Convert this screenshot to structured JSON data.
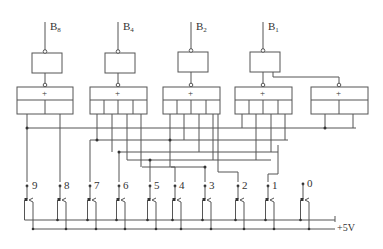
{
  "outputs": [
    {
      "name": "B",
      "sub": "8",
      "x": 45
    },
    {
      "name": "B",
      "sub": "4",
      "x": 118
    },
    {
      "name": "B",
      "sub": "2",
      "x": 191
    },
    {
      "name": "B",
      "sub": "1",
      "x": 263
    }
  ],
  "gates": {
    "or_symbol": "+"
  },
  "switches": [
    {
      "label": "9",
      "x": 27
    },
    {
      "label": "8",
      "x": 60
    },
    {
      "label": "7",
      "x": 90
    },
    {
      "label": "6",
      "x": 119
    },
    {
      "label": "5",
      "x": 150
    },
    {
      "label": "4",
      "x": 175
    },
    {
      "label": "3",
      "x": 205
    },
    {
      "label": "2",
      "x": 238
    },
    {
      "label": "1",
      "x": 268
    },
    {
      "label": "0",
      "x": 303
    }
  ],
  "supply": {
    "label": "+5V"
  }
}
